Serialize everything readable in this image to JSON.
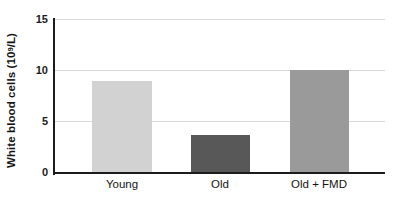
{
  "chart_data": {
    "type": "bar",
    "title": "",
    "xlabel": "",
    "ylabel": "White blood cells (10⁹/L)",
    "ylabel_text": "White blood cells (10",
    "ylabel_sup": "9",
    "ylabel_tail": "/L)",
    "categories": [
      "Young",
      "Old",
      "Old + FMD"
    ],
    "values": [
      9.0,
      3.7,
      10.0
    ],
    "bar_colors": [
      "#d2d2d2",
      "#585858",
      "#9a9a9a"
    ],
    "series": [
      {
        "name": "White blood cells",
        "values": [
          9.0,
          3.7,
          10.0
        ]
      }
    ],
    "ylim": [
      0,
      15
    ],
    "yticks": [
      0,
      5,
      10,
      15
    ],
    "ytick_labels": [
      "0",
      "5",
      "10",
      "15"
    ],
    "grid": true,
    "grid_axis": "y",
    "legend": false,
    "legend_position": "none",
    "axis_color": "#1c1c1c",
    "grid_color": "#d9d9d9",
    "background": "#ffffff"
  },
  "axes": {
    "y_tick_0": "0",
    "y_tick_1": "5",
    "y_tick_2": "10",
    "y_tick_3": "15"
  },
  "bars": {
    "bar_0_label": "Young",
    "bar_1_label": "Old",
    "bar_2_label": "Old + FMD"
  }
}
